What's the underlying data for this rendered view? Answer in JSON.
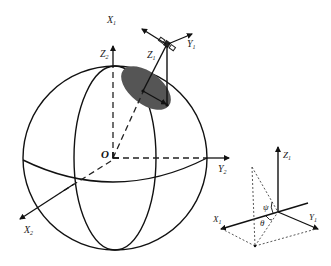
{
  "diagram": {
    "colors": {
      "stroke": "#111111",
      "ellipse_fill": "#555555",
      "dashed": "#333333",
      "background": "#ffffff"
    },
    "earth_frame": {
      "origin_label": "O",
      "x_axis": {
        "base": "X",
        "sub": "2"
      },
      "y_axis": {
        "base": "Y",
        "sub": "2"
      },
      "z_axis": {
        "base": "Z",
        "sub": "2"
      }
    },
    "satellite_frame": {
      "icon": "satellite-icon",
      "x_axis": {
        "base": "X",
        "sub": "1"
      },
      "y_axis": {
        "base": "Y",
        "sub": "1"
      },
      "z_axis": {
        "base": "Z",
        "sub": "1"
      }
    },
    "inset_frame": {
      "x_axis": {
        "base": "X",
        "sub": "1"
      },
      "y_axis": {
        "base": "Y",
        "sub": "1"
      },
      "z_axis": {
        "base": "Z",
        "sub": "1"
      },
      "angle_psi": "ψ",
      "angle_theta": "θ"
    }
  }
}
